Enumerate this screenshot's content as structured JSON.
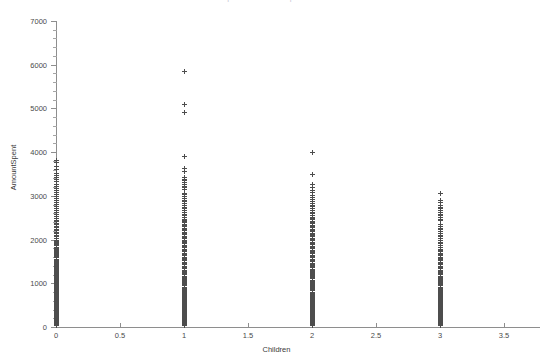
{
  "chart_data": {
    "type": "scatter",
    "title": "Scatterplot of AmountSpent vs Children",
    "xlabel": "Children",
    "ylabel": "AmountSpent",
    "xlim": [
      0,
      3.5
    ],
    "ylim": [
      0,
      7000
    ],
    "xticks": [
      "0",
      "0.5",
      "1",
      "1.5",
      "2",
      "2.5",
      "3",
      "3.5"
    ],
    "xtick_values": [
      0,
      0.5,
      1,
      1.5,
      2,
      2.5,
      3,
      3.5
    ],
    "yticks": [
      "0",
      "1000",
      "2000",
      "3000",
      "4000",
      "5000",
      "6000",
      "7000"
    ],
    "ytick_values": [
      0,
      1000,
      2000,
      3000,
      4000,
      5000,
      6000,
      7000
    ],
    "grid": false,
    "legend": null,
    "marker": "plus",
    "marker_color": "#4d4d4d",
    "axis_color": "#8e8e8e",
    "series": [
      {
        "name": "AmountSpent",
        "points_by_category": [
          {
            "x": 0,
            "note": "Densest column; mass concentrated below 1700, tapering to ~3800 max",
            "y": [
              30,
              45,
              55,
              62,
              70,
              78,
              85,
              92,
              98,
              105,
              112,
              118,
              125,
              130,
              136,
              142,
              148,
              152,
              158,
              163,
              168,
              172,
              178,
              183,
              188,
              192,
              197,
              202,
              207,
              211,
              216,
              220,
              225,
              229,
              234,
              238,
              243,
              247,
              252,
              256,
              261,
              265,
              270,
              274,
              279,
              283,
              288,
              292,
              297,
              301,
              306,
              310,
              315,
              319,
              324,
              328,
              333,
              337,
              342,
              346,
              351,
              355,
              360,
              364,
              369,
              373,
              378,
              382,
              387,
              391,
              396,
              400,
              405,
              409,
              414,
              418,
              423,
              427,
              432,
              436,
              441,
              445,
              450,
              454,
              459,
              463,
              468,
              472,
              477,
              481,
              486,
              490,
              495,
              499,
              504,
              508,
              513,
              517,
              522,
              526,
              531,
              535,
              540,
              544,
              549,
              553,
              558,
              562,
              567,
              571,
              576,
              580,
              585,
              589,
              594,
              598,
              603,
              607,
              612,
              616,
              621,
              625,
              630,
              634,
              639,
              643,
              648,
              652,
              657,
              661,
              666,
              670,
              675,
              679,
              684,
              688,
              693,
              697,
              702,
              706,
              711,
              715,
              720,
              724,
              729,
              733,
              738,
              742,
              747,
              751,
              756,
              760,
              765,
              769,
              774,
              778,
              783,
              787,
              792,
              796,
              805,
              815,
              825,
              835,
              845,
              855,
              865,
              875,
              885,
              895,
              905,
              915,
              925,
              935,
              945,
              955,
              965,
              975,
              985,
              995,
              1010,
              1025,
              1040,
              1055,
              1070,
              1085,
              1100,
              1115,
              1130,
              1145,
              1160,
              1175,
              1190,
              1205,
              1220,
              1235,
              1255,
              1275,
              1295,
              1315,
              1335,
              1355,
              1375,
              1395,
              1415,
              1435,
              1455,
              1475,
              1495,
              1515,
              1535,
              1555,
              1580,
              1605,
              1630,
              1655,
              1680,
              1705,
              1730,
              1755,
              1780,
              1805,
              1830,
              1855,
              1880,
              1905,
              1930,
              1955,
              1990,
              2025,
              2060,
              2095,
              2130,
              2165,
              2200,
              2235,
              2270,
              2305,
              2340,
              2375,
              2410,
              2445,
              2480,
              2525,
              2570,
              2615,
              2660,
              2705,
              2750,
              2795,
              2840,
              2885,
              2930,
              2975,
              3020,
              3070,
              3120,
              3170,
              3220,
              3270,
              3320,
              3370,
              3420,
              3470,
              3520,
              3600,
              3680,
              3760,
              3800
            ]
          },
          {
            "x": 1,
            "note": "Three high outliers near 5850, 5100 and 4900; main mass below 2600",
            "y": [
              5850,
              5100,
              4900,
              3900,
              3620,
              3560,
              3420,
              3380,
              3340,
              3300,
              3260,
              3220,
              3180,
              3150,
              3060,
              3020,
              2980,
              2940,
              2900,
              2860,
              2820,
              2780,
              2740,
              2700,
              2660,
              2620,
              2580,
              2540,
              2500,
              2470,
              2440,
              2410,
              2380,
              2350,
              2320,
              2290,
              2260,
              2230,
              2200,
              2170,
              2140,
              2110,
              2080,
              2050,
              2020,
              1990,
              1960,
              1930,
              1900,
              1870,
              1840,
              1810,
              1780,
              1750,
              1720,
              1690,
              1660,
              1630,
              1600,
              1570,
              1540,
              1510,
              1480,
              1450,
              1420,
              1390,
              1360,
              1330,
              1300,
              1270,
              1240,
              1215,
              1190,
              1165,
              1140,
              1115,
              1090,
              1065,
              1040,
              1015,
              990,
              965,
              940,
              915,
              890,
              865,
              840,
              815,
              795,
              775,
              755,
              735,
              715,
              695,
              675,
              655,
              635,
              615,
              595,
              575,
              558,
              541,
              524,
              507,
              490,
              473,
              456,
              439,
              422,
              405,
              390,
              375,
              360,
              345,
              330,
              315,
              300,
              288,
              276,
              264,
              252,
              240,
              228,
              216,
              205,
              194,
              183,
              172,
              161,
              150,
              140,
              130,
              120,
              110,
              100,
              90,
              80,
              70,
              62,
              54,
              46,
              38,
              30
            ]
          },
          {
            "x": 2,
            "note": "Top point near 4000; second near 3500; main mass below 2500",
            "y": [
              4000,
              3500,
              3250,
              3190,
              3130,
              3070,
              3010,
              2960,
              2910,
              2870,
              2830,
              2790,
              2750,
              2710,
              2670,
              2630,
              2590,
              2550,
              2510,
              2480,
              2450,
              2420,
              2390,
              2360,
              2330,
              2300,
              2270,
              2240,
              2210,
              2180,
              2150,
              2120,
              2090,
              2060,
              2030,
              2000,
              1970,
              1940,
              1910,
              1880,
              1850,
              1820,
              1790,
              1760,
              1730,
              1700,
              1670,
              1640,
              1610,
              1580,
              1550,
              1520,
              1490,
              1460,
              1430,
              1400,
              1375,
              1350,
              1325,
              1300,
              1275,
              1250,
              1225,
              1200,
              1175,
              1150,
              1125,
              1100,
              1075,
              1050,
              1025,
              1000,
              975,
              950,
              925,
              900,
              875,
              850,
              825,
              800,
              778,
              756,
              734,
              712,
              690,
              668,
              646,
              624,
              602,
              580,
              560,
              540,
              520,
              500,
              480,
              460,
              440,
              422,
              404,
              386,
              368,
              350,
              334,
              318,
              302,
              286,
              270,
              256,
              242,
              228,
              214,
              200,
              188,
              176,
              164,
              152,
              140,
              130,
              120,
              110,
              100,
              90,
              80,
              70,
              60,
              50,
              42,
              34
            ]
          },
          {
            "x": 3,
            "note": "Top point near 3050; compact column, mass below 2000",
            "y": [
              3050,
              2900,
              2840,
              2790,
              2740,
              2700,
              2660,
              2620,
              2580,
              2540,
              2500,
              2470,
              2440,
              2350,
              2310,
              2260,
              2220,
              2180,
              2140,
              2100,
              2060,
              2020,
              1980,
              1940,
              1900,
              1860,
              1820,
              1780,
              1750,
              1720,
              1690,
              1660,
              1630,
              1600,
              1570,
              1540,
              1510,
              1480,
              1450,
              1420,
              1390,
              1360,
              1330,
              1300,
              1270,
              1240,
              1215,
              1190,
              1165,
              1140,
              1115,
              1090,
              1065,
              1040,
              1015,
              990,
              965,
              940,
              915,
              890,
              865,
              840,
              818,
              796,
              774,
              752,
              730,
              708,
              686,
              664,
              642,
              620,
              600,
              580,
              560,
              540,
              520,
              500,
              480,
              462,
              444,
              426,
              408,
              390,
              372,
              356,
              340,
              324,
              308,
              292,
              276,
              262,
              248,
              234,
              220,
              206,
              192,
              180,
              168,
              156,
              144,
              132,
              120,
              110,
              100,
              90,
              80,
              70,
              60,
              52,
              44,
              36
            ]
          }
        ]
      }
    ]
  },
  "axis_geometry": {
    "x_origin_px": 56,
    "x_unit_px": 128,
    "y_origin_px": 327,
    "y_unit_px": 0.0437
  }
}
